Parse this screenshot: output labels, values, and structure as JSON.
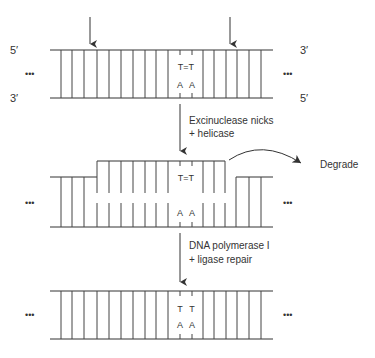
{
  "colors": {
    "ink": "#333333",
    "background": "#ffffff"
  },
  "panel1": {
    "label_top_left": "5′",
    "label_bottom_left": "3′",
    "label_top_right": "3′",
    "label_bottom_right": "5′",
    "ellipsis_left": "•••",
    "ellipsis_right": "•••",
    "damage_top": "T=T",
    "damage_bottom_left": "A",
    "damage_bottom_right": "A",
    "cut_arrows": [
      "cut-site-left",
      "cut-site-right"
    ]
  },
  "step1": {
    "line1": "Excinuclease nicks",
    "line2": "+ helicase"
  },
  "panel2": {
    "ellipsis_left": "•••",
    "ellipsis_right": "•••",
    "fragment_label": "T=T",
    "bottom_left": "A",
    "bottom_right": "A",
    "degrade_label": "Degrade"
  },
  "step2": {
    "line1": "DNA polymerase I",
    "line2": "+ ligase repair"
  },
  "panel3": {
    "ellipsis_left": "•••",
    "ellipsis_right": "•••",
    "top_left": "T",
    "top_right": "T",
    "bottom_left": "A",
    "bottom_right": "A"
  }
}
